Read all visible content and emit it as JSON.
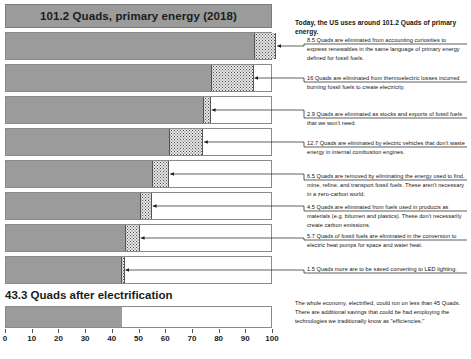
{
  "header": {
    "banner_label": "101.2 Quads, primary energy (2018)",
    "lead_note": "Today, the US uses around 101.2 Quads of primary energy."
  },
  "footer": {
    "title": "43.3 Quads after electrification",
    "summary_note": "The whole economy, electrified, could run on less than 45 Quads.  There are additional savings that could be had employing the technologies we traditionally know as \"efficiencies.\""
  },
  "axis": {
    "min": 0,
    "max": 100,
    "ticks": [
      0,
      10,
      20,
      30,
      40,
      50,
      60,
      70,
      80,
      90,
      100
    ]
  },
  "chart_data": {
    "type": "bar",
    "title": "101.2 Quads, primary energy (2018)",
    "xlabel": "",
    "ylabel": "",
    "xlim": [
      0,
      100
    ],
    "grid": false,
    "legend": "none",
    "units": "Quads",
    "total_start": 101.2,
    "total_end": 43.3,
    "steps": [
      {
        "label": "accounting curiosities (renewables)",
        "amount": 8.5,
        "remaining_before": 101.2,
        "base_end": 92.7,
        "cut_start": 92.7,
        "cut_end": 101.2,
        "note": "8.5 Quads are eliminated from accounting curiosities to express renewables in the same language of primary energy defined for fossil fuels."
      },
      {
        "label": "thermoelectric losses",
        "amount": 16.0,
        "remaining_before": 92.7,
        "base_end": 76.7,
        "cut_start": 76.7,
        "cut_end": 92.7,
        "note": "16 Quads are eliminated from thermoelectric losses incurred burning fossil fuels to create electricity."
      },
      {
        "label": "stocks and exports of fossil fuels",
        "amount": 2.9,
        "remaining_before": 76.7,
        "base_end": 73.8,
        "cut_start": 73.8,
        "cut_end": 76.7,
        "note": "2.9 Quads are eliminated as stocks and exports of fossil fuels that we won't need."
      },
      {
        "label": "electric vehicles",
        "amount": 12.7,
        "remaining_before": 73.8,
        "base_end": 61.1,
        "cut_start": 61.1,
        "cut_end": 73.8,
        "note": "12.7 Quads are eliminated by electric vehicles that don't waste energy in internal combustion engines."
      },
      {
        "label": "energy used to find, mine, refine and transport fossil fuels",
        "amount": 6.5,
        "remaining_before": 61.1,
        "base_end": 54.6,
        "cut_start": 54.6,
        "cut_end": 61.1,
        "note": "6.5 Quads are removed by eliminating the energy used to find, mine, refine, and transport fossil fuels. These aren't necessary in a zero-carbon world."
      },
      {
        "label": "fuels used in products as materials",
        "amount": 4.5,
        "remaining_before": 54.6,
        "base_end": 50.1,
        "cut_start": 50.1,
        "cut_end": 54.6,
        "note": "4.5 Quads are eliminated from fuels used in products as materials (e.g. bitumen and plastics). These don't necessarily create carbon emissions."
      },
      {
        "label": "electric heat pumps",
        "amount": 5.7,
        "remaining_before": 50.1,
        "base_end": 44.4,
        "cut_start": 44.4,
        "cut_end": 50.1,
        "note": "5.7 Quads of fossil fuels are eliminated in the conversion to electric heat pumps for space and water heat."
      },
      {
        "label": "LED lighting",
        "amount": 1.5,
        "remaining_before": 44.4,
        "base_end": 42.9,
        "cut_start": 42.9,
        "cut_end": 44.4,
        "note": "1.5 Quads more are to be saved converting to LED lighting."
      }
    ]
  },
  "colors": {
    "bar_fill": "#9b9b9b",
    "bar_stroke": "#8a8a8a",
    "cut_fill": "#e9e9e9",
    "text": "#141414",
    "background": "#ffffff"
  }
}
